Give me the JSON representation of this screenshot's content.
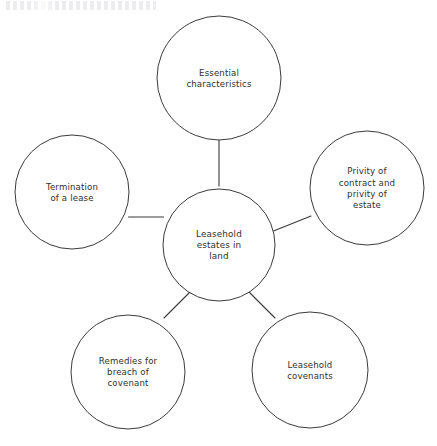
{
  "diagram": {
    "type": "mind-map",
    "stroke_color": "#3a3a3a",
    "text_color": "#2f2f2f",
    "background_color": "#ffffff",
    "hub": {
      "id": "hub",
      "label": "Leasehold estates in land",
      "lines": [
        "Leasehold",
        "estates in",
        "land"
      ],
      "cx": 219,
      "cy": 245,
      "r": 56
    },
    "nodes": [
      {
        "id": "essential-characteristics",
        "label": "Essential characteristics",
        "lines": [
          "Essential",
          "characteristics"
        ],
        "cx": 219,
        "cy": 78,
        "r": 62,
        "position": "top"
      },
      {
        "id": "privity",
        "label": "Privity of contract and privity of estate",
        "lines": [
          "Privity of",
          "contract and",
          "privity of",
          "estate"
        ],
        "cx": 367,
        "cy": 188,
        "r": 57,
        "position": "right"
      },
      {
        "id": "leasehold-covenants",
        "label": "Leasehold covenants",
        "lines": [
          "Leasehold",
          "covenants"
        ],
        "cx": 310,
        "cy": 370,
        "r": 58,
        "position": "bottom-right"
      },
      {
        "id": "remedies",
        "label": "Remedies for breach of covenant",
        "lines": [
          "Remedies for",
          "breach of",
          "covenant"
        ],
        "cx": 128,
        "cy": 372,
        "r": 57,
        "position": "bottom-left"
      },
      {
        "id": "termination",
        "label": "Termination of a lease",
        "lines": [
          "Termination",
          "of a lease"
        ],
        "cx": 72,
        "cy": 192,
        "r": 57,
        "position": "left"
      }
    ],
    "connectors": [
      {
        "id": "hub-to-essential-characteristics",
        "from": "hub",
        "to": "essential-characteristics",
        "x1": 219,
        "y1": 186,
        "x2": 219,
        "y2": 140
      },
      {
        "id": "hub-to-privity",
        "from": "hub",
        "to": "privity",
        "x1": 273.5,
        "y1": 231,
        "x2": 311,
        "y2": 216
      },
      {
        "id": "hub-to-leasehold-covenants",
        "from": "hub",
        "to": "leasehold-covenants",
        "x1": 249,
        "y1": 292,
        "x2": 275,
        "y2": 318
      },
      {
        "id": "hub-to-remedies",
        "from": "hub",
        "to": "remedies",
        "x1": 190,
        "y1": 292,
        "x2": 164,
        "y2": 318
      },
      {
        "id": "hub-to-termination",
        "from": "hub",
        "to": "termination",
        "x1": 163.5,
        "y1": 217,
        "x2": 128.5,
        "y2": 217
      }
    ]
  }
}
